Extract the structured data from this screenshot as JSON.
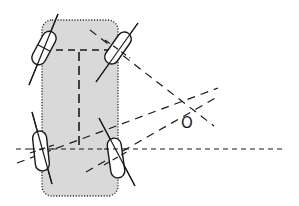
{
  "diagram": {
    "type": "vehicle-steering-geometry",
    "colors": {
      "background": "#ffffff",
      "body_fill": "#d9d9d9",
      "stroke": "#1a1a1a"
    },
    "body": {
      "x": 42,
      "y": 20,
      "width": 76,
      "height": 176,
      "corner_radius": 10
    },
    "wheels": [
      {
        "id": "front-left",
        "cx": 44,
        "cy": 48,
        "angle": 30
      },
      {
        "id": "front-right",
        "cx": 118,
        "cy": 48,
        "angle": 35
      },
      {
        "id": "rear-left",
        "cx": 41,
        "cy": 150,
        "angle": -15
      },
      {
        "id": "rear-right",
        "cx": 116,
        "cy": 158,
        "angle": -28
      }
    ],
    "turning_center": {
      "label": "O",
      "x": 186,
      "y": 107
    }
  }
}
